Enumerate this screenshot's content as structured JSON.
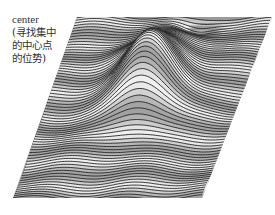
{
  "figure": {
    "annotation_lines": [
      "center",
      "(寻找集中",
      "的中心点",
      "的位势)"
    ]
  },
  "chart_data": {
    "type": "surface",
    "title": "",
    "annotation": "center (寻找集中的中心点的位势)",
    "projection_corners_px": {
      "top_left": [
        77,
        17
      ],
      "top_right": [
        272,
        17
      ],
      "bottom_right": [
        202,
        198
      ],
      "bottom_left": [
        13,
        198
      ]
    },
    "features": [
      {
        "type": "peak",
        "center_u": 0.52,
        "center_v": 0.42,
        "height": 60,
        "width_u": 0.17,
        "width_v": 0.2
      },
      {
        "type": "dip",
        "center_u": 0.62,
        "center_v": 0.05,
        "depth": 8,
        "width_u": 0.1,
        "width_v": 0.05
      },
      {
        "type": "ridge",
        "center_u": 0.3,
        "center_v": 0.25,
        "height": 8,
        "width_u": 0.15,
        "width_v": 0.08
      }
    ],
    "line_count": 70,
    "line_color": "#222222",
    "background_color": "#ffffff",
    "xlabel": "",
    "ylabel": "",
    "zlabel": ""
  }
}
